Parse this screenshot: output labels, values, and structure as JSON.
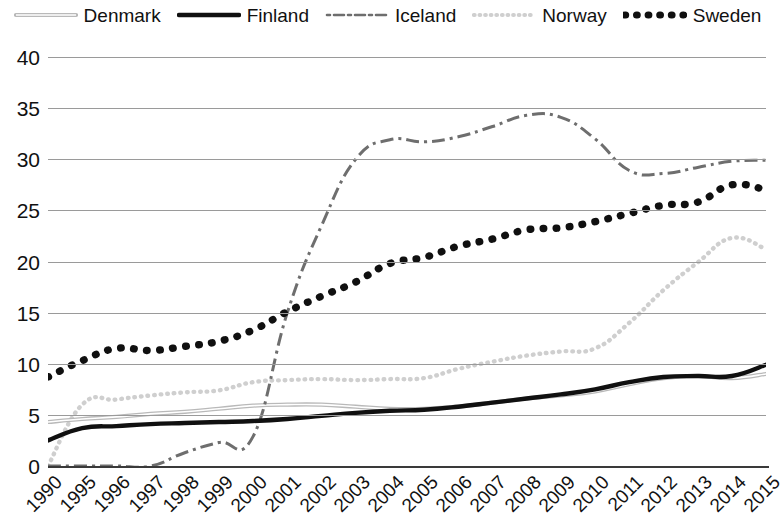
{
  "chart_data": {
    "type": "line",
    "title": "",
    "subtitle": "",
    "xlabel": "",
    "ylabel": "",
    "ylim": [
      0,
      40
    ],
    "yticks": [
      0,
      5,
      10,
      15,
      20,
      25,
      30,
      35,
      40
    ],
    "grid": true,
    "legend_position": "top",
    "categories": [
      "1990",
      "1995",
      "1996",
      "1997",
      "1998",
      "1999",
      "2000",
      "2001",
      "2002",
      "2003",
      "2004",
      "2005",
      "2006",
      "2007",
      "2008",
      "2009",
      "2010",
      "2011",
      "2012",
      "2013",
      "2014",
      "2015"
    ],
    "series": [
      {
        "name": "Denmark",
        "style": "solid-light-double",
        "color": "#b9b9b9",
        "values": [
          4.3,
          4.6,
          4.8,
          5.1,
          5.3,
          5.6,
          5.9,
          6.0,
          6.0,
          5.8,
          5.6,
          5.6,
          5.8,
          6.2,
          6.6,
          6.9,
          7.3,
          8.0,
          8.6,
          8.8,
          8.6,
          9.0
        ]
      },
      {
        "name": "Finland",
        "style": "solid-thick-black",
        "color": "#101010",
        "values": [
          2.5,
          3.7,
          3.9,
          4.1,
          4.2,
          4.3,
          4.4,
          4.6,
          4.9,
          5.2,
          5.4,
          5.5,
          5.8,
          6.2,
          6.6,
          7.0,
          7.5,
          8.2,
          8.7,
          8.8,
          8.8,
          9.9
        ]
      },
      {
        "name": "Iceland",
        "style": "dash-dot",
        "color": "#6e6e6e",
        "values": [
          0.0,
          0.0,
          0.0,
          0.0,
          1.3,
          2.3,
          2.9,
          15.0,
          23.5,
          30.0,
          31.9,
          31.7,
          32.2,
          33.2,
          34.3,
          34.1,
          32.0,
          28.9,
          28.6,
          29.2,
          29.8,
          29.9
        ]
      },
      {
        "name": "Norway",
        "style": "dotted-light",
        "color": "#cfcfcf",
        "values": [
          0.0,
          6.0,
          6.5,
          6.9,
          7.2,
          7.4,
          8.2,
          8.4,
          8.5,
          8.4,
          8.5,
          8.6,
          9.5,
          10.2,
          10.8,
          11.2,
          11.5,
          14.0,
          17.2,
          19.9,
          22.3,
          21.2
        ]
      },
      {
        "name": "Sweden",
        "style": "dotted-thick-black",
        "color": "#101010",
        "values": [
          8.7,
          10.3,
          11.5,
          11.3,
          11.7,
          12.2,
          13.3,
          15.1,
          16.6,
          18.0,
          19.8,
          20.4,
          21.5,
          22.2,
          23.1,
          23.3,
          23.9,
          24.7,
          25.5,
          25.8,
          27.5,
          27.0
        ]
      }
    ]
  },
  "legend": {
    "items": [
      {
        "label": "Denmark",
        "icon": "line-swatch-denmark"
      },
      {
        "label": "Finland",
        "icon": "line-swatch-finland"
      },
      {
        "label": "Iceland",
        "icon": "line-swatch-iceland"
      },
      {
        "label": "Norway",
        "icon": "line-swatch-norway"
      },
      {
        "label": "Sweden",
        "icon": "line-swatch-sweden"
      }
    ]
  },
  "axes": {
    "y_tick_labels": [
      "40",
      "35",
      "30",
      "25",
      "20",
      "15",
      "10",
      "5",
      "0"
    ],
    "x_tick_labels": [
      "1990",
      "1995",
      "1996",
      "1997",
      "1998",
      "1999",
      "2000",
      "2001",
      "2002",
      "2003",
      "2004",
      "2005",
      "2006",
      "2007",
      "2008",
      "2009",
      "2010",
      "2011",
      "2012",
      "2013",
      "2014",
      "2015"
    ]
  },
  "colors": {
    "grid": "#9a9a9a",
    "axis": "#3a3a3a",
    "text": "#111111",
    "denmark": "#b9b9b9",
    "finland": "#101010",
    "iceland": "#6e6e6e",
    "norway": "#cfcfcf",
    "sweden": "#101010"
  }
}
